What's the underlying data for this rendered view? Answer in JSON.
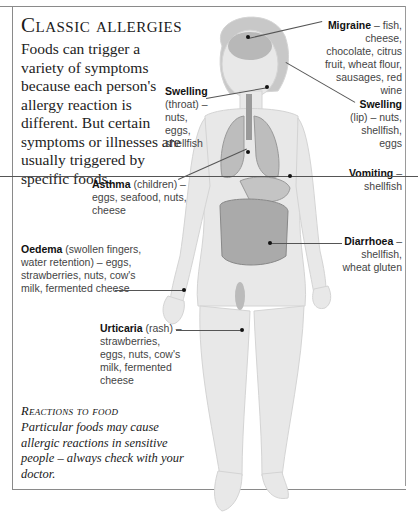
{
  "title": "Classic allergies",
  "intro": "Foods can trigger a variety of symptoms because each person's allergy reaction is different. But certain symptoms or illnesses are usually triggered by specific foods.",
  "labels": {
    "migraine": {
      "term": "Migraine",
      "text": " – fish, cheese, chocolate, citrus fruit, wheat flour, sausages, red wine"
    },
    "swelling_throat": {
      "term": "Swelling",
      "text": " (throat) – nuts, eggs, shellfish"
    },
    "swelling_lip": {
      "term": "Swelling",
      "text": " (lip) – nuts, shellfish, eggs"
    },
    "asthma": {
      "term": "Asthma",
      "text": " (children) – eggs, seafood, nuts, cheese"
    },
    "vomiting": {
      "term": "Vomiting",
      "text": " – shellfish"
    },
    "oedema": {
      "term": "Oedema",
      "text": " (swollen fingers, water retention) – eggs, strawberries, nuts, cow's milk, fermented cheese"
    },
    "diarrhoea": {
      "term": "Diarrhoea",
      "text": " – shellfish, wheat gluten"
    },
    "urticaria": {
      "term": "Urticaria",
      "text": " (rash) – strawberries, eggs, nuts, cow's milk, fermented cheese"
    }
  },
  "footer": {
    "title": "Reactions to food",
    "text": "Particular foods may cause allergic reactions in sensitive people – always check with your doctor."
  },
  "colors": {
    "frame": "#8a8a8a",
    "figure": "#e6e6e6",
    "organs": "#9a9a9a"
  }
}
